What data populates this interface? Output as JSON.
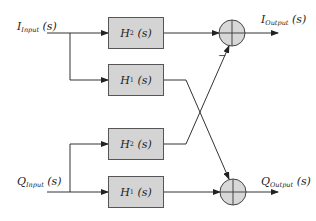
{
  "diagram": {
    "inputs": {
      "i_input": {
        "main": "I",
        "sub": "Input",
        "arg": "(s)"
      },
      "q_input": {
        "main": "Q",
        "sub": "Input",
        "arg": "(s)"
      }
    },
    "outputs": {
      "i_output": {
        "main": "I",
        "sub": "Output",
        "arg": "(s)"
      },
      "q_output": {
        "main": "Q",
        "sub": "Output",
        "arg": "(s)"
      }
    },
    "blocks": [
      {
        "main": "H",
        "sub": "2",
        "arg": "(s)"
      },
      {
        "main": "H",
        "sub": "1",
        "arg": "(s)"
      },
      {
        "main": "H",
        "sub": "2",
        "arg": "(s)"
      },
      {
        "main": "H",
        "sub": "1",
        "arg": "(s)"
      }
    ],
    "summing_junctions": 2,
    "minus_sign": "−",
    "colors": {
      "block_fill": "#d4d4d4",
      "line": "#333333",
      "sum_fill": "#d8d8d8"
    }
  }
}
